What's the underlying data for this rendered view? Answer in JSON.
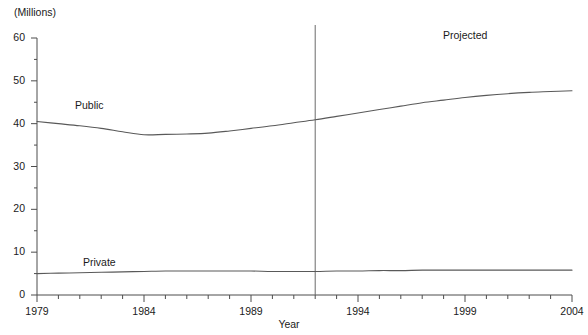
{
  "chart": {
    "partial_title": "",
    "unit_label": "(Millions)",
    "xlabel": "Year",
    "projected_label": "Projected",
    "public_label": "Public",
    "private_label": "Private"
  },
  "chart_data": {
    "type": "line",
    "title": "",
    "subtitle": "(Millions)",
    "xlabel": "Year",
    "ylabel": "(Millions)",
    "xlim": [
      1979,
      2004
    ],
    "ylim": [
      0,
      60
    ],
    "yticks": [
      0,
      10,
      20,
      30,
      40,
      50,
      60
    ],
    "ytick_labels": [
      "0",
      "10",
      "20",
      "30",
      "40",
      "50",
      "60"
    ],
    "y_minor_ticks": [
      5,
      15,
      25,
      35,
      45,
      55
    ],
    "xticks": [
      1979,
      1984,
      1989,
      1994,
      1999,
      2004
    ],
    "xtick_labels": [
      "1979",
      "1984",
      "1989",
      "1994",
      "1999",
      "2004"
    ],
    "x_minor_ticks": [
      1980,
      1981,
      1982,
      1983,
      1985,
      1986,
      1987,
      1988,
      1990,
      1991,
      1992,
      1993,
      1995,
      1996,
      1997,
      1998,
      2000,
      2001,
      2002,
      2003
    ],
    "grid": false,
    "legend_position": "inline-annotations",
    "annotations": [
      {
        "text": "Public",
        "x": 1982.5,
        "y": 44.5
      },
      {
        "text": "Private",
        "x": 1983.0,
        "y": 8.5
      },
      {
        "text": "Projected",
        "x": 1998.0,
        "y": 57.5
      }
    ],
    "projection_divider_x": 1992,
    "x": [
      1979,
      1980,
      1981,
      1982,
      1983,
      1984,
      1985,
      1986,
      1987,
      1988,
      1989,
      1990,
      1991,
      1992,
      1993,
      1994,
      1995,
      1996,
      1997,
      1998,
      1999,
      2000,
      2001,
      2002,
      2003,
      2004
    ],
    "series": [
      {
        "name": "Public",
        "color": "#595959",
        "values": [
          40.5,
          40.0,
          39.5,
          38.9,
          38.1,
          37.4,
          37.5,
          37.6,
          37.8,
          38.3,
          38.9,
          39.5,
          40.2,
          40.9,
          41.7,
          42.5,
          43.3,
          44.1,
          44.9,
          45.5,
          46.1,
          46.6,
          47.0,
          47.3,
          47.5,
          47.7
        ]
      },
      {
        "name": "Private",
        "color": "#595959",
        "values": [
          5.0,
          5.1,
          5.2,
          5.3,
          5.4,
          5.5,
          5.6,
          5.6,
          5.6,
          5.6,
          5.6,
          5.5,
          5.5,
          5.5,
          5.6,
          5.6,
          5.7,
          5.7,
          5.8,
          5.8,
          5.8,
          5.8,
          5.8,
          5.8,
          5.8,
          5.8
        ]
      }
    ]
  }
}
